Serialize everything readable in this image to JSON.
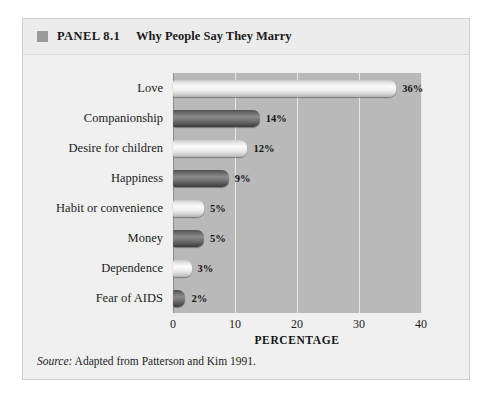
{
  "panel": {
    "marker": "square-marker",
    "number": "PANEL 8.1",
    "title": "Why People Say They Marry",
    "source_prefix": "Source:",
    "source_text": " Adapted from Patterson and Kim 1991.",
    "background": "#f0f0f0",
    "plot_background": "#b9b9b9",
    "gridline_color": "#e8e8e8"
  },
  "chart_data": {
    "type": "bar",
    "orientation": "horizontal",
    "title": "Why People Say They Marry",
    "xlabel": "PERCENTAGE",
    "ylabel": "",
    "xlim": [
      0,
      40
    ],
    "xticks": [
      0,
      10,
      20,
      30,
      40
    ],
    "xtick_labels": [
      "0",
      "10",
      "20",
      "30",
      "40"
    ],
    "grid": true,
    "legend": "none",
    "categories": [
      "Love",
      "Companionship",
      "Desire for children",
      "Happiness",
      "Habit or convenience",
      "Money",
      "Dependence",
      "Fear of AIDS"
    ],
    "values": [
      36,
      14,
      12,
      9,
      5,
      5,
      3,
      2
    ],
    "value_labels": [
      "36%",
      "14%",
      "12%",
      "9%",
      "5%",
      "5%",
      "3%",
      "2%"
    ],
    "bar_shades": [
      "light",
      "dark",
      "light",
      "dark",
      "light",
      "dark",
      "light",
      "dark"
    ]
  }
}
